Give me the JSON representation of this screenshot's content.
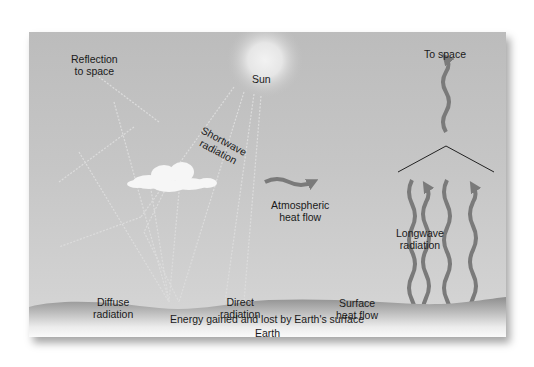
{
  "diagram": {
    "labels": {
      "reflection": [
        "Reflection",
        "to space"
      ],
      "sun": "Sun",
      "shortwave": [
        "Shortwave",
        "radiation"
      ],
      "to_space": "To space",
      "atmospheric": [
        "Atmospheric",
        "heat flow"
      ],
      "longwave": [
        "Longwave",
        "radiation"
      ],
      "diffuse": [
        "Diffuse",
        "radiation"
      ],
      "direct": [
        "Direct",
        "radiation"
      ],
      "surface": [
        "Surface",
        "heat flow"
      ],
      "energy": "Energy gained and lost by Earth's surface",
      "earth": "Earth"
    },
    "colors": {
      "sky": "#c4c4c4",
      "arrow": "#7a7a7a",
      "ground": "#9a9a9a",
      "text": "#1a1a1a"
    }
  }
}
